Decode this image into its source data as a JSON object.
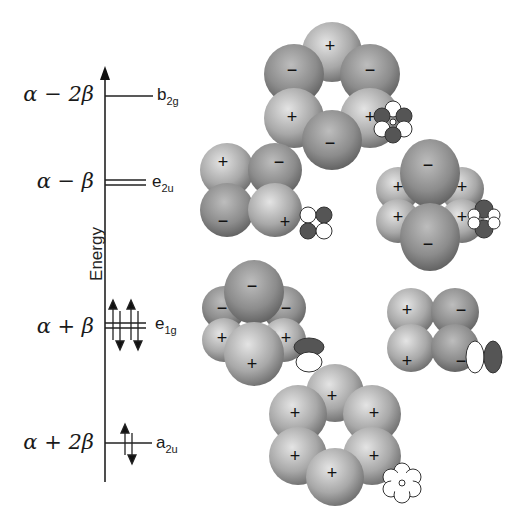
{
  "diagram": {
    "axis_label": "Energy",
    "levels": [
      {
        "energy": "α − 2β",
        "symmetry": "b",
        "sub": "2g",
        "degeneracy": 1,
        "electrons": 0
      },
      {
        "energy": "α − β",
        "symmetry": "e",
        "sub": "2u",
        "degeneracy": 2,
        "electrons": 0
      },
      {
        "energy": "α + β",
        "symmetry": "e",
        "sub": "1g",
        "degeneracy": 2,
        "electrons": 4
      },
      {
        "energy": "α + 2β",
        "symmetry": "a",
        "sub": "2u",
        "degeneracy": 1,
        "electrons": 2
      }
    ],
    "orbitals": [
      {
        "id": "b2g",
        "lobes": [
          "+",
          "−",
          "−",
          "+",
          "+",
          "−"
        ]
      },
      {
        "id": "e2u-a",
        "lobes": [
          "+",
          "−",
          "−",
          "+"
        ]
      },
      {
        "id": "e2u-b",
        "lobes": [
          "−",
          "+",
          "+",
          "+",
          "+",
          "−"
        ]
      },
      {
        "id": "e1g-a",
        "lobes": [
          "−",
          "−",
          "−",
          "+",
          "+",
          "+"
        ]
      },
      {
        "id": "e1g-b",
        "lobes": [
          "+",
          "−",
          "+",
          "−"
        ]
      },
      {
        "id": "a2u",
        "lobes": [
          "+",
          "+",
          "+",
          "+",
          "+",
          "+"
        ]
      }
    ]
  }
}
